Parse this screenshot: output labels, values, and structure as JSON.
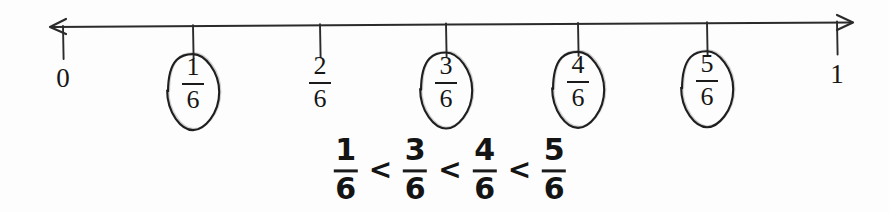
{
  "figure": {
    "kind": "fraction-number-line",
    "background_color": "#fdfdfd",
    "ink_color": "#1b1b1b"
  },
  "chart_data": {
    "type": "line",
    "title": "",
    "subtitle": "",
    "xlabel": "",
    "ylabel": "",
    "xlim": [
      0,
      1
    ],
    "grid": false,
    "legend": null,
    "axis": {
      "left_arrow": true,
      "right_arrow": true,
      "left_arrow_x": 50,
      "right_arrow_x": 852,
      "axis_y": 25,
      "tick_length": 32
    },
    "categories": [
      "0",
      "1/6",
      "2/6",
      "3/6",
      "4/6",
      "5/6",
      "1"
    ],
    "values": [
      0,
      0.1667,
      0.3333,
      0.5,
      0.6667,
      0.8333,
      1
    ],
    "ticks": [
      {
        "x": 63,
        "label_kind": "whole",
        "whole": "0",
        "numerator": "",
        "denominator": "",
        "circled": false
      },
      {
        "x": 193,
        "label_kind": "fraction",
        "whole": "",
        "numerator": "1",
        "denominator": "6",
        "circled": true
      },
      {
        "x": 320,
        "label_kind": "fraction",
        "whole": "",
        "numerator": "2",
        "denominator": "6",
        "circled": false
      },
      {
        "x": 446,
        "label_kind": "fraction",
        "whole": "",
        "numerator": "3",
        "denominator": "6",
        "circled": true
      },
      {
        "x": 578,
        "label_kind": "fraction",
        "whole": "",
        "numerator": "4",
        "denominator": "6",
        "circled": true
      },
      {
        "x": 707,
        "label_kind": "fraction",
        "whole": "",
        "numerator": "5",
        "denominator": "6",
        "circled": true
      },
      {
        "x": 837,
        "label_kind": "whole",
        "whole": "1",
        "numerator": "",
        "denominator": "",
        "circled": false
      }
    ],
    "annotations": [
      {
        "name": "inequality-statement",
        "text": "1/6 < 3/6 < 4/6 < 5/6",
        "x": 450,
        "y": 170
      }
    ]
  },
  "axis_labels": {
    "zero": "0",
    "one": "1",
    "one_sixth": {
      "numerator": "1",
      "denominator": "6"
    },
    "two_sixths": {
      "numerator": "2",
      "denominator": "6"
    },
    "three_sixths": {
      "numerator": "3",
      "denominator": "6"
    },
    "four_sixths": {
      "numerator": "4",
      "denominator": "6"
    },
    "five_sixths": {
      "numerator": "5",
      "denominator": "6"
    }
  },
  "inequality": {
    "terms": [
      {
        "numerator": "1",
        "denominator": "6"
      },
      {
        "numerator": "3",
        "denominator": "6"
      },
      {
        "numerator": "4",
        "denominator": "6"
      },
      {
        "numerator": "5",
        "denominator": "6"
      }
    ],
    "operators": [
      "<",
      "<",
      "<"
    ],
    "plain_text": "1/6 < 3/6 < 4/6 < 5/6"
  }
}
